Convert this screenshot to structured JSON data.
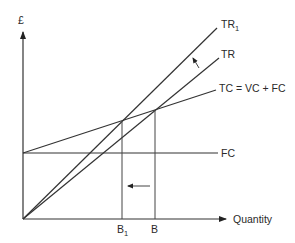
{
  "diagram": {
    "type": "break-even chart",
    "y_axis_label": "£",
    "x_axis_label": "Quantity",
    "lines": {
      "tr1": {
        "label": "TR",
        "subscript": "1"
      },
      "tr": {
        "label": "TR"
      },
      "tc": {
        "label": "TC = VC + FC"
      },
      "fc": {
        "label": "FC"
      }
    },
    "x_markers": {
      "b1": {
        "label": "B",
        "subscript": "1"
      },
      "b": {
        "label": "B"
      }
    },
    "annotations": {
      "shift_arrow_revenue": "TR rotates up to TR1",
      "shift_arrow_breakeven": "break-even moves left from B to B1"
    },
    "colors": {
      "line": "#333333",
      "text": "#2a2a2a",
      "background": "#ffffff"
    }
  }
}
